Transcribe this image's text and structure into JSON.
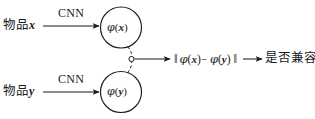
{
  "figure": {
    "type": "diagram",
    "background_color": "#ffffff",
    "stroke_color": "#1b1b1b"
  },
  "inputs": [
    {
      "id": "item-x",
      "text_prefix": "物品",
      "variable": "x",
      "edge_label": "CNN"
    },
    {
      "id": "item-y",
      "text_prefix": "物品",
      "variable": "y",
      "edge_label": "CNN"
    }
  ],
  "nodes": [
    {
      "id": "embedding-x",
      "phi": "φ",
      "open_paren": "(",
      "variable": "x",
      "close_paren": ")"
    },
    {
      "id": "embedding-y",
      "phi": "φ",
      "open_paren": "(",
      "variable": "y",
      "close_paren": ")"
    }
  ],
  "junction": {
    "id": "merge-point",
    "shape": "hollow-circle"
  },
  "distance": {
    "left_norm": "‖",
    "phi_1": "φ",
    "arg_1_open": "(",
    "arg_1": "x",
    "arg_1_close": ")",
    "operator": "−",
    "phi_2": "φ",
    "arg_2_open": "(",
    "arg_2": "y",
    "arg_2_close": ")",
    "right_norm": "‖"
  },
  "output": {
    "id": "compatibility-question",
    "text": "是否兼容?"
  },
  "arrows": {
    "cnn_x": "arrow-right",
    "cnn_y": "arrow-right",
    "merge_to_distance": "arrow-right",
    "distance_to_output": "arrow-right"
  }
}
